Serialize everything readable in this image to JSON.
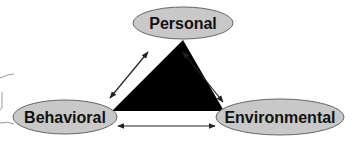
{
  "diagram": {
    "type": "reciprocal-determinism-triad",
    "nodes": {
      "personal": {
        "label": "Personal"
      },
      "behavioral": {
        "label": "Behavioral"
      },
      "environmental": {
        "label": "Environmental"
      }
    },
    "edges": [
      {
        "from": "behavioral",
        "to": "personal",
        "direction": "bidirectional"
      },
      {
        "from": "personal",
        "to": "environmental",
        "direction": "bidirectional"
      },
      {
        "from": "behavioral",
        "to": "environmental",
        "direction": "bidirectional"
      }
    ],
    "colors": {
      "ellipse_fill": "#c8c8c8",
      "ellipse_stroke": "#555555",
      "triangle_fill": "#000000",
      "arrow": "#222222",
      "text": "#111111"
    }
  }
}
